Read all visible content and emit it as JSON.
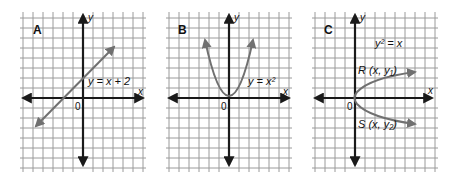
{
  "panels": [
    {
      "letter": "A",
      "equation": "y = x + 2",
      "x_label": "x",
      "y_label": "y",
      "origin_label": "0",
      "curve_type": "line",
      "curve_color": "#707070"
    },
    {
      "letter": "B",
      "equation": "y = x²",
      "x_label": "x",
      "y_label": "y",
      "origin_label": "0",
      "curve_type": "parabola-up",
      "curve_color": "#707070"
    },
    {
      "letter": "C",
      "equation": "y² = x",
      "x_label": "x",
      "y_label": "y",
      "origin_label": "0",
      "curve_type": "parabola-right",
      "curve_color": "#707070",
      "point_r": "R (x, y₁)",
      "point_s": "S (x, y₂)"
    }
  ],
  "colors": {
    "grid": "#9a9a9a",
    "axis": "#1a1a1a",
    "curve": "#707070"
  }
}
